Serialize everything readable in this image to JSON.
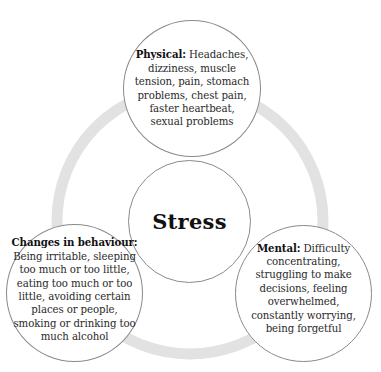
{
  "diagram": {
    "center": {
      "label": "Stress"
    },
    "nodes": [
      {
        "id": "physical",
        "heading": "Physical:",
        "text": " Headaches, dizziness, muscle tension, pain, stomach problems, chest pain, faster heartbeat, sexual problems"
      },
      {
        "id": "mental",
        "heading": "Mental:",
        "text": " Difficulty concentrating, struggling to make decisions, feeling overwhelmed, constantly worrying, being forgetful"
      },
      {
        "id": "behaviour",
        "heading": "Changes in behaviour:",
        "text": " Being irritable, sleeping too much or too little, eating too much or too little, avoiding certain places or people, smoking or drinking too much alcohol"
      }
    ],
    "colors": {
      "ring": "#e2e2e2",
      "circle_border": "#8a8a8a",
      "background": "#ffffff",
      "text": "#2a2a2a"
    }
  }
}
